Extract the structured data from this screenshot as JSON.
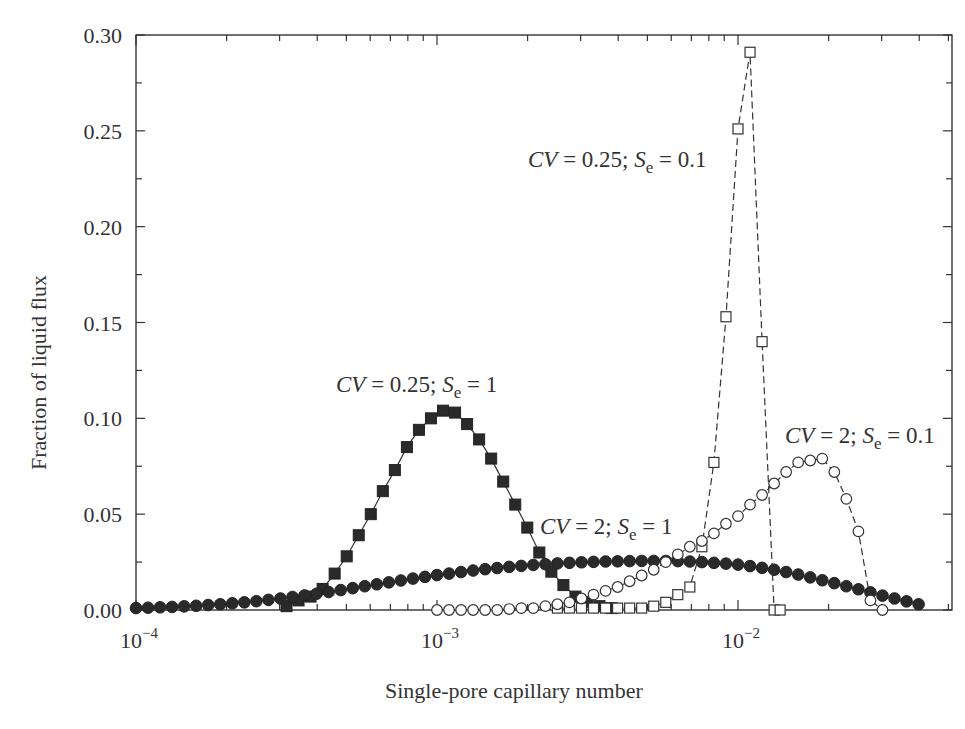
{
  "chart_data": {
    "type": "line",
    "title": "",
    "xlabel": "Single-pore capillary number",
    "ylabel": "Fraction of liquid flux",
    "xscale": "log",
    "xlim": [
      0.0001,
      0.051
    ],
    "ylim": [
      0,
      0.3
    ],
    "grid": false,
    "legend": "inline annotations",
    "x_ticks": [
      {
        "value": 0.0001,
        "label": "10",
        "exp": "−4"
      },
      {
        "value": 0.001,
        "label": "10",
        "exp": "−3"
      },
      {
        "value": 0.01,
        "label": "10",
        "exp": "−2"
      }
    ],
    "y_ticks": [
      "0.00",
      "0.05",
      "0.10",
      "0.15",
      "0.20",
      "0.25",
      "0.30"
    ],
    "series": [
      {
        "name": "CV = 0.25; Se = 1",
        "marker": "filled-square",
        "line": "solid",
        "annotation": {
          "cv": "CV",
          "cv_val": " = 0.25; ",
          "s": "S",
          "sub": "e",
          "tail": " = 1",
          "x_px": 336,
          "y_px": 392
        },
        "log10x": [
          -3.5,
          -3.46,
          -3.42,
          -3.38,
          -3.34,
          -3.3,
          -3.26,
          -3.22,
          -3.18,
          -3.14,
          -3.1,
          -3.06,
          -3.02,
          -2.98,
          -2.94,
          -2.9,
          -2.86,
          -2.82,
          -2.78,
          -2.74,
          -2.7,
          -2.66,
          -2.62,
          -2.58,
          -2.54,
          -2.5,
          -2.46,
          -2.42
        ],
        "values": [
          0.002,
          0.005,
          0.007,
          0.011,
          0.019,
          0.028,
          0.039,
          0.05,
          0.062,
          0.073,
          0.085,
          0.094,
          0.1,
          0.104,
          0.103,
          0.097,
          0.089,
          0.079,
          0.067,
          0.055,
          0.043,
          0.03,
          0.02,
          0.013,
          0.007,
          0.004,
          0.002,
          0.001
        ]
      },
      {
        "name": "CV = 2; Se = 1",
        "marker": "filled-circle",
        "line": "solid",
        "annotation": {
          "cv": "CV",
          "cv_val": " = 2; ",
          "s": "S",
          "sub": "e",
          "tail": " = 1",
          "x_px": 540,
          "y_px": 534
        },
        "log10x": [
          -4.0,
          -3.96,
          -3.92,
          -3.88,
          -3.84,
          -3.8,
          -3.76,
          -3.72,
          -3.68,
          -3.64,
          -3.6,
          -3.56,
          -3.52,
          -3.48,
          -3.44,
          -3.4,
          -3.36,
          -3.32,
          -3.28,
          -3.24,
          -3.2,
          -3.16,
          -3.12,
          -3.08,
          -3.04,
          -3.0,
          -2.96,
          -2.92,
          -2.88,
          -2.84,
          -2.8,
          -2.76,
          -2.72,
          -2.68,
          -2.64,
          -2.6,
          -2.56,
          -2.52,
          -2.48,
          -2.44,
          -2.4,
          -2.36,
          -2.32,
          -2.28,
          -2.24,
          -2.2,
          -2.16,
          -2.12,
          -2.08,
          -2.04,
          -2.0,
          -1.96,
          -1.92,
          -1.88,
          -1.84,
          -1.8,
          -1.76,
          -1.72,
          -1.68,
          -1.64,
          -1.6,
          -1.56,
          -1.52,
          -1.48,
          -1.44,
          -1.4
        ],
        "values": [
          0.001,
          0.0012,
          0.0014,
          0.0016,
          0.0019,
          0.0022,
          0.0026,
          0.003,
          0.0035,
          0.004,
          0.0046,
          0.0053,
          0.006,
          0.0068,
          0.0076,
          0.0085,
          0.0094,
          0.0104,
          0.0114,
          0.0124,
          0.0134,
          0.0144,
          0.0154,
          0.0164,
          0.0173,
          0.0182,
          0.019,
          0.0198,
          0.0206,
          0.0213,
          0.0219,
          0.0225,
          0.023,
          0.0235,
          0.0239,
          0.0243,
          0.0246,
          0.0249,
          0.0251,
          0.0253,
          0.0254,
          0.0255,
          0.0256,
          0.0256,
          0.0256,
          0.0255,
          0.0253,
          0.025,
          0.0246,
          0.0242,
          0.0237,
          0.0229,
          0.022,
          0.021,
          0.0198,
          0.0185,
          0.017,
          0.0155,
          0.014,
          0.0124,
          0.0108,
          0.0092,
          0.0075,
          0.006,
          0.0045,
          0.003
        ]
      },
      {
        "name": "CV = 0.25; Se = 0.1",
        "marker": "open-square",
        "line": "dashed",
        "annotation": {
          "cv": "CV",
          "cv_val": " = 0.25; ",
          "s": "S",
          "sub": "e",
          "tail": " = 0.1",
          "x_px": 528,
          "y_px": 167
        },
        "log10x": [
          -2.6,
          -2.56,
          -2.52,
          -2.48,
          -2.44,
          -2.4,
          -2.36,
          -2.32,
          -2.28,
          -2.24,
          -2.2,
          -2.16,
          -2.12,
          -2.08,
          -2.04,
          -2.0,
          -1.96,
          -1.92,
          -1.88,
          -1.86
        ],
        "values": [
          0.001,
          0.001,
          0.001,
          0.001,
          0.001,
          0.001,
          0.001,
          0.001,
          0.002,
          0.004,
          0.008,
          0.012,
          0.033,
          0.077,
          0.153,
          0.251,
          0.291,
          0.14,
          0.0,
          0.0
        ]
      },
      {
        "name": "CV = 2; Se = 0.1",
        "marker": "open-circle",
        "line": "dashed",
        "annotation": {
          "cv": "CV",
          "cv_val": " = 2; ",
          "s": "S",
          "sub": "e",
          "tail": " = 0.1",
          "x_px": 785,
          "y_px": 443
        },
        "log10x": [
          -3.0,
          -2.96,
          -2.92,
          -2.88,
          -2.84,
          -2.8,
          -2.76,
          -2.72,
          -2.68,
          -2.64,
          -2.6,
          -2.56,
          -2.52,
          -2.48,
          -2.44,
          -2.4,
          -2.36,
          -2.32,
          -2.28,
          -2.24,
          -2.2,
          -2.16,
          -2.12,
          -2.08,
          -2.04,
          -2.0,
          -1.96,
          -1.92,
          -1.88,
          -1.84,
          -1.8,
          -1.76,
          -1.72,
          -1.68,
          -1.64
        ],
        "values": [
          0.0,
          0.0,
          0.0,
          0.0,
          0.0,
          0.0,
          0.0005,
          0.001,
          0.001,
          0.002,
          0.003,
          0.004,
          0.006,
          0.008,
          0.01,
          0.012,
          0.015,
          0.018,
          0.021,
          0.025,
          0.029,
          0.033,
          0.036,
          0.04,
          0.045,
          0.049,
          0.055,
          0.06,
          0.066,
          0.072,
          0.077,
          0.078,
          0.079,
          0.072,
          0.058
        ]
      }
    ],
    "open_circle_tail": {
      "log10x": [
        -1.6,
        -1.56,
        -1.52
      ],
      "values": [
        0.041,
        0.005,
        0.0
      ]
    }
  },
  "page": {
    "xlabel": "Single-pore capillary number",
    "ylabel": "Fraction of liquid flux"
  }
}
